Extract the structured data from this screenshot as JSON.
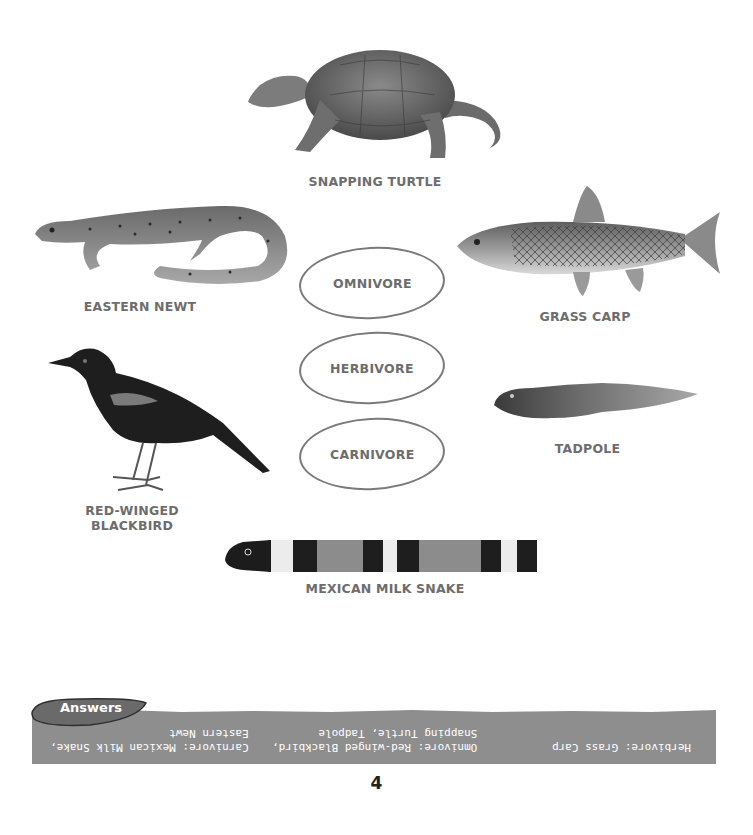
{
  "animals": [
    {
      "id": "snapping-turtle",
      "label": "SNAPPING TURTLE"
    },
    {
      "id": "eastern-newt",
      "label": "EASTERN NEWT"
    },
    {
      "id": "grass-carp",
      "label": "GRASS CARP"
    },
    {
      "id": "red-winged-blackbird",
      "label": "RED-WINGED\nBLACKBIRD"
    },
    {
      "id": "tadpole",
      "label": "TADPOLE"
    },
    {
      "id": "mexican-milk-snake",
      "label": "MEXICAN MILK SNAKE"
    }
  ],
  "categories": [
    {
      "label": "OMNIVORE"
    },
    {
      "label": "HERBIVORE"
    },
    {
      "label": "CARNIVORE"
    }
  ],
  "answers": {
    "tab_label": "Answers",
    "herbivore": "Herbivore: Grass Carp",
    "omnivore": "Omnivore: Red-winged Blackbird,\nSnapping Turtle, Tadpole",
    "carnivore": "Carnivore: Mexican Milk Snake,\nEastern Newt",
    "bar_color": "#8e8e8e",
    "tab_color": "#6a6a6a"
  },
  "page_number": "4"
}
